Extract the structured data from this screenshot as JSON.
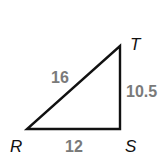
{
  "figure": {
    "type": "right-triangle",
    "vertices": [
      {
        "name": "R",
        "label": "R"
      },
      {
        "name": "S",
        "label": "S"
      },
      {
        "name": "T",
        "label": "T"
      }
    ],
    "sides": [
      {
        "between": "RT",
        "label": "16"
      },
      {
        "between": "ST",
        "label": "10.5"
      },
      {
        "between": "RS",
        "label": "12"
      }
    ],
    "colors": {
      "stroke": "#111111",
      "side_label": "#7a7a7a",
      "vertex_label": "#111111"
    }
  }
}
